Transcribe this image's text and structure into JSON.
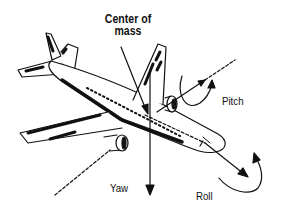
{
  "diagram": {
    "labels": {
      "center_of_mass_line1": "Center of",
      "center_of_mass_line2": "mass",
      "pitch": "Pitch",
      "yaw": "Yaw",
      "roll": "Roll"
    },
    "axes": [
      {
        "name": "pitch",
        "direction": "lateral, through wings, arrow toward upper right"
      },
      {
        "name": "yaw",
        "direction": "vertical, arrow pointing down"
      },
      {
        "name": "roll",
        "direction": "longitudinal, through nose, arrow toward lower right"
      }
    ],
    "colors": {
      "ink": "#111111",
      "background": "#ffffff"
    }
  }
}
